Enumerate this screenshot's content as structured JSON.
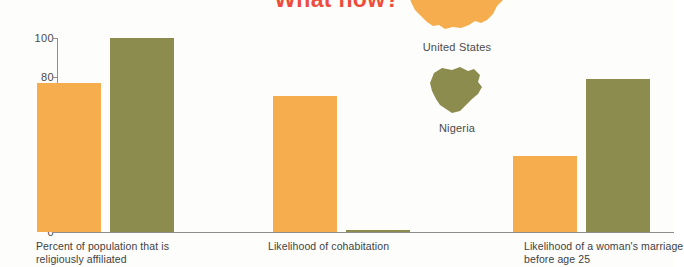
{
  "title": "What now?",
  "title_color": "#ee4d3d",
  "legend": {
    "position": "top-right",
    "items": [
      {
        "label": "United States",
        "color": "#f5ad4e",
        "icon": "map-united-states"
      },
      {
        "label": "Nigeria",
        "color": "#8c8c4f",
        "icon": "map-nigeria"
      }
    ]
  },
  "chart_data": {
    "type": "bar",
    "title": "What now?",
    "xlabel": "",
    "ylabel": "",
    "ylim": [
      0,
      100
    ],
    "yticks": [
      0,
      20,
      40,
      60,
      80,
      100
    ],
    "grid": false,
    "legend_position": "top-right",
    "categories": [
      "Percent of population that is religiously affiliated",
      "Likelihood of cohabitation",
      "Likelihood of a woman's marriage before age 25"
    ],
    "series": [
      {
        "name": "United States",
        "color": "#f5ad4e",
        "values": [
          77,
          70,
          39
        ]
      },
      {
        "name": "Nigeria",
        "color": "#8c8c4f",
        "values": [
          100,
          1,
          79
        ]
      }
    ]
  }
}
